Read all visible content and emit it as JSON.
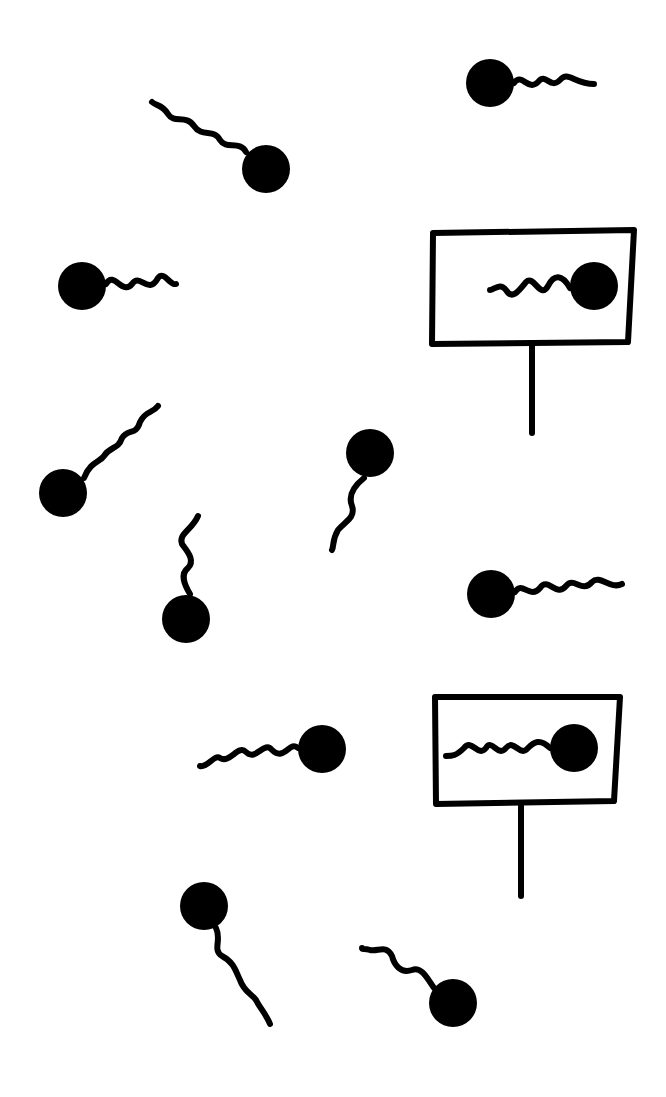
{
  "diagram": {
    "background": "#ffffff",
    "ink": "#000000",
    "free_molecules": [
      {
        "id": "m1",
        "head": [
          490,
          83
        ],
        "r": 24,
        "tail": "M514,83 C522,72 528,92 538,82 C546,72 550,90 560,80 C568,70 574,84 594,84"
      },
      {
        "id": "m2",
        "head": [
          266,
          169
        ],
        "r": 24,
        "tail": "M246,152 C240,140 226,150 220,140 C214,128 202,138 194,126 C186,114 174,124 168,114 C162,104 156,106 152,102"
      },
      {
        "id": "m3",
        "head": [
          82,
          286
        ],
        "r": 24,
        "tail": "M106,284 C114,270 122,296 132,284 C140,272 148,296 158,278 C164,270 170,286 176,284"
      },
      {
        "id": "m4",
        "head": [
          63,
          493
        ],
        "r": 24,
        "tail": "M84,478 C90,462 100,462 104,456 C110,446 118,450 122,438 C128,428 136,436 140,422 C146,410 152,414 158,406"
      },
      {
        "id": "m5",
        "head": [
          370,
          453
        ],
        "r": 24,
        "tail": "M364,478 C354,486 348,496 352,506 C356,518 344,522 338,530 C332,540 334,546 332,550"
      },
      {
        "id": "m6",
        "head": [
          186,
          619
        ],
        "r": 24,
        "tail": "M190,594 C184,584 180,574 188,568 C196,560 186,550 182,544 C178,534 192,530 198,516"
      },
      {
        "id": "m7",
        "head": [
          491,
          594
        ],
        "r": 24,
        "tail": "M515,592 C522,580 530,600 540,588 C548,576 556,598 566,586 C574,576 582,594 592,582 C600,574 610,590 622,584"
      },
      {
        "id": "m8",
        "head": [
          322,
          749
        ],
        "r": 24,
        "tail": "M298,748 C290,740 284,762 272,750 C264,740 256,762 246,752 C238,744 230,764 220,758 C214,754 208,768 200,766"
      },
      {
        "id": "m9",
        "head": [
          204,
          906
        ],
        "r": 24,
        "tail": "M216,928 C222,940 212,950 222,956 C234,962 236,972 240,980 C244,992 252,994 256,1000 C260,1008 266,1014 270,1024"
      },
      {
        "id": "m10",
        "head": [
          453,
          1003
        ],
        "r": 24,
        "tail": "M434,988 C428,980 422,966 412,970 C400,974 394,964 392,956 C386,944 378,952 370,950 C364,948 362,950 362,948"
      }
    ],
    "receptors": [
      {
        "id": "r1",
        "frame": "M433,233 L634,230 L628,342 L432,344 Z",
        "post": "M532,344 L532,433",
        "molecule": {
          "head": [
            594,
            286
          ],
          "r": 24,
          "tail": "M570,288 C562,274 554,274 548,286 C540,300 534,274 526,282 C518,292 512,300 506,290 C500,282 494,290 490,290"
        }
      },
      {
        "id": "r2",
        "frame": "M435,697 L620,697 L614,801 L436,804 Z",
        "post": "M521,804 L521,896",
        "molecule": {
          "head": [
            574,
            748
          ],
          "r": 24,
          "tail": "M550,748 C540,738 534,742 528,748 C520,758 514,738 506,748 C498,758 492,738 486,748 C478,758 472,738 464,748 C456,756 452,756 446,756"
        }
      }
    ]
  }
}
